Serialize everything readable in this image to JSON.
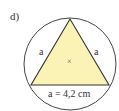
{
  "task_label": "d)",
  "figure": {
    "type": "equilateral triangle inscribed in circle",
    "side_labels": [
      "a",
      "a"
    ],
    "base_label": "a = 4,2 cm",
    "center_marker": "×",
    "colors": {
      "triangle_fill": "#fbf3b6",
      "stroke": "#333333",
      "circle_stroke": "#444444"
    }
  }
}
